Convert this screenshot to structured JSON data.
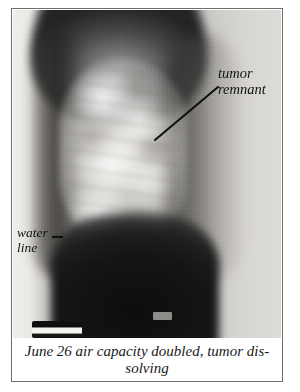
{
  "figure": {
    "kind": "radiograph-figure",
    "caption": {
      "line1": "June 26 air capacity doubled, tumor dis-",
      "line2": "solving",
      "full_text": "June 26 air capacity doubled, tumor dissolving"
    },
    "annotations": [
      {
        "id": "tumor-remnant",
        "line1": "tumor",
        "line2": "remnant",
        "full_text": "tumor remnant",
        "leader": {
          "from_x": 218,
          "from_y": 87,
          "to_x": 155,
          "to_y": 140
        }
      },
      {
        "id": "water-line",
        "line1": "water",
        "line2": "line",
        "full_text": "water line",
        "leader": {
          "from_x": 52,
          "from_y": 237,
          "to_x": 63,
          "to_y": 237
        }
      }
    ],
    "markers": [
      {
        "id": "opaque-strip",
        "label": ""
      },
      {
        "id": "chip-marker",
        "label": ""
      }
    ],
    "colors": {
      "page_background": "#ffffff",
      "frame_rule": "#6e6e6e",
      "film_light": "#eceae7",
      "film_mid": "#b6b4b0",
      "film_dark": "#141414",
      "annotation_text": "#121212",
      "caption_text": "#1a1a1a",
      "leader_line": "#0f0f0f"
    }
  }
}
